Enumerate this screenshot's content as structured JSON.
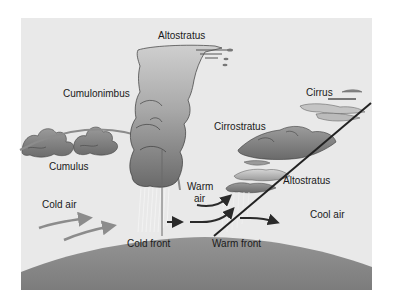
{
  "diagram": {
    "colors": {
      "sky": "#e9e9e9",
      "ground": "#8a8a8a",
      "cloud_dark": "#6e6e6e",
      "cloud_light": "#bdbdbd",
      "arrow_gray": "#8c8c8c",
      "arrow_dark": "#2a2a2a",
      "front_line": "#222222"
    },
    "labels": {
      "altostratus_top": "Altostratus",
      "cumulonimbus": "Cumulonimbus",
      "cirrus": "Cirrus",
      "cirrostratus": "Cirrostratus",
      "cumulus": "Cumulus",
      "altostratus_right": "Altostratus",
      "warm_air_line1": "Warm",
      "warm_air_line2": "air",
      "cold_air": "Cold air",
      "cool_air": "Cool air",
      "cold_front": "Cold front",
      "warm_front": "Warm front"
    }
  }
}
